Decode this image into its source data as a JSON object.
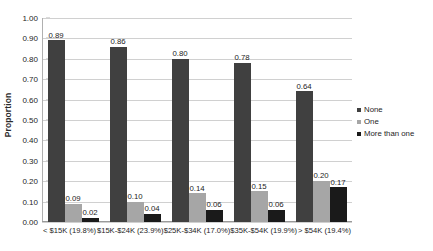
{
  "chart_data": {
    "type": "bar",
    "title": "",
    "subtitle": "",
    "xlabel": "",
    "ylabel": "Proportion",
    "ylim": [
      0.0,
      1.0
    ],
    "ytick_step": 0.1,
    "grid": "horizontal",
    "legend_position": "right",
    "categories": [
      "< $15K (19.8%)",
      "$15K-$24K (23.9%)",
      "$25K-$34K (17.0%)",
      "$35K-$54K (19.9%)",
      "> $54K (19.4%)"
    ],
    "series": [
      {
        "name": "None",
        "color": "#404040",
        "values": [
          0.89,
          0.86,
          0.8,
          0.78,
          0.64
        ],
        "labels": [
          "0.89",
          "0.86",
          "0.80",
          "0.78",
          "0.64"
        ]
      },
      {
        "name": "One",
        "color": "#a6a6a6",
        "values": [
          0.09,
          0.1,
          0.14,
          0.15,
          0.2
        ],
        "labels": [
          "0.09",
          "0.10",
          "0.14",
          "0.15",
          "0.20"
        ]
      },
      {
        "name": "More than one",
        "color": "#1a1a1a",
        "values": [
          0.02,
          0.04,
          0.06,
          0.06,
          0.17
        ],
        "labels": [
          "0.02",
          "0.04",
          "0.06",
          "0.06",
          "0.17"
        ]
      }
    ],
    "ytick_labels": [
      "1.00",
      "0.90",
      "0.80",
      "0.70",
      "0.60",
      "0.50",
      "0.40",
      "0.30",
      "0.20",
      "0.10",
      "0.00"
    ],
    "ytick_values": [
      1.0,
      0.9,
      0.8,
      0.7,
      0.6,
      0.5,
      0.4,
      0.3,
      0.2,
      0.1,
      0.0
    ]
  }
}
